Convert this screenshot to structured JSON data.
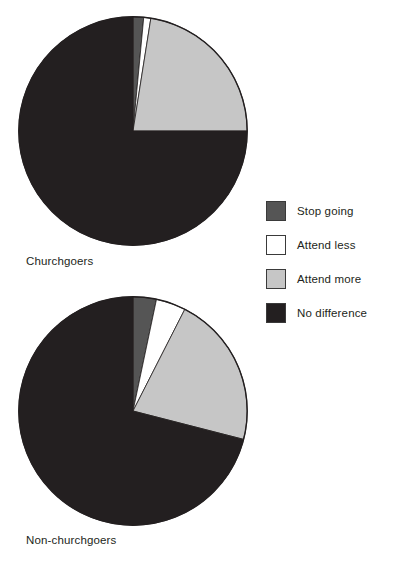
{
  "figure": {
    "background": "#ffffff"
  },
  "legend": {
    "position": "right",
    "items": [
      {
        "label": "Stop going",
        "color": "#555555",
        "name": "legend-item-stop-going"
      },
      {
        "label": "Attend less",
        "color": "#ffffff",
        "name": "legend-item-attend-less"
      },
      {
        "label": "Attend more",
        "color": "#c6c6c6",
        "name": "legend-item-attend-more"
      },
      {
        "label": "No difference",
        "color": "#231f20",
        "name": "legend-item-no-difference"
      }
    ]
  },
  "captions": {
    "pie1": "Churchgoers",
    "pie2": "Non-churchgoers"
  },
  "chart_data": [
    {
      "type": "pie",
      "title": "Churchgoers",
      "categories": [
        "Stop going",
        "Attend less",
        "Attend more",
        "No difference"
      ],
      "values": [
        1.5,
        1.0,
        22.5,
        75.0
      ],
      "colors": [
        "#555555",
        "#ffffff",
        "#c6c6c6",
        "#231f20"
      ],
      "start_angle_deg": 0,
      "direction": "clockwise",
      "units": "percent",
      "legend": "right",
      "grid": false
    },
    {
      "type": "pie",
      "title": "Non-churchgoers",
      "categories": [
        "Stop going",
        "Attend less",
        "Attend more",
        "No difference"
      ],
      "values": [
        3.3,
        4.2,
        21.5,
        71.0
      ],
      "colors": [
        "#555555",
        "#ffffff",
        "#c6c6c6",
        "#231f20"
      ],
      "start_angle_deg": 0,
      "direction": "clockwise",
      "units": "percent",
      "legend": "right",
      "grid": false
    }
  ]
}
